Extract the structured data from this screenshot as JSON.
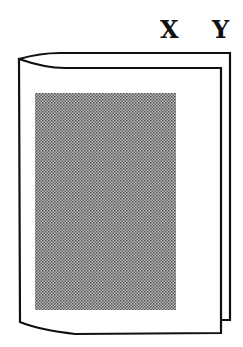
{
  "labels": {
    "x": "X",
    "y": "Y"
  },
  "figure": {
    "shade_color": "#9a9a9a",
    "stroke_color": "#111111"
  }
}
